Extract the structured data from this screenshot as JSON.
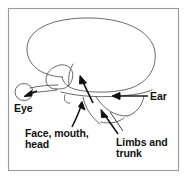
{
  "figure": {
    "frame": {
      "border_color": "#9a9a9a",
      "background": "#ffffff"
    },
    "stroke_color": "#1a1a1a",
    "outline_color": "#555555",
    "structures": [
      {
        "name": "cerebrum",
        "description": "large oval cortex outline"
      },
      {
        "name": "temporal-lobe",
        "description": "lower rounded lobe"
      },
      {
        "name": "eye-bulb",
        "description": "small oval at front connected by optic nerve"
      },
      {
        "name": "brainstem",
        "description": "stem extending from base"
      },
      {
        "name": "cerebellum",
        "description": "curved lobe at lower rear"
      }
    ],
    "labels": [
      {
        "id": "eye",
        "text": "Eye",
        "x": 14,
        "y": 112,
        "lines": [
          "Eye"
        ]
      },
      {
        "id": "ear",
        "text": "Ear",
        "x": 150,
        "y": 100,
        "lines": [
          "Ear"
        ]
      },
      {
        "id": "face-mouth-head",
        "text": "Face, mouth, head",
        "x": 25,
        "y": 137,
        "lines": [
          "Face, mouth,",
          "head"
        ]
      },
      {
        "id": "limbs-and-trunk",
        "text": "Limbs and trunk",
        "x": 116,
        "y": 146,
        "lines": [
          "Limbs and",
          "trunk"
        ]
      }
    ],
    "arrows": [
      {
        "id": "eye-arrow",
        "points_to": "eye-bulb",
        "direction": "left"
      },
      {
        "id": "ear-arrow",
        "points_to": "auditory-cortex",
        "direction": "left"
      },
      {
        "id": "face-arrow",
        "points_to": "face-motor-strip",
        "direction": "up"
      },
      {
        "id": "limbs-arrow",
        "points_to": "limbs-motor-strip",
        "direction": "up-left"
      },
      {
        "id": "motor-strip-arrow",
        "points_to": "motor-cortex",
        "direction": "up-right"
      }
    ]
  }
}
